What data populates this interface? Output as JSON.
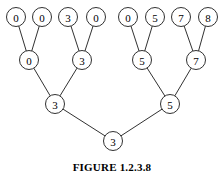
{
  "figure": {
    "caption": "FIGURE 1.2.3.8",
    "background_color": "#ffffff",
    "line_color": "#1a1a1a",
    "node_fill_color": "#ffffff",
    "text_color": "#000000"
  },
  "chart_data": {
    "type": "diagram",
    "diagram_kind": "binary-tournament-tree",
    "title": "FIGURE 1.2.3.8",
    "node_radius": 9.5,
    "levels": [
      {
        "level": 0,
        "name": "leaf-level",
        "y": 17,
        "nodes": [
          {
            "id": "L0",
            "label": "0",
            "x": 16,
            "y": 17
          },
          {
            "id": "L1",
            "label": "0",
            "x": 42,
            "y": 17
          },
          {
            "id": "L2",
            "label": "3",
            "x": 68,
            "y": 17
          },
          {
            "id": "L3",
            "label": "0",
            "x": 96,
            "y": 17
          },
          {
            "id": "L4",
            "label": "0",
            "x": 128,
            "y": 17
          },
          {
            "id": "L5",
            "label": "5",
            "x": 155,
            "y": 17
          },
          {
            "id": "L6",
            "label": "7",
            "x": 181,
            "y": 17
          },
          {
            "id": "L7",
            "label": "8",
            "x": 208,
            "y": 17
          }
        ]
      },
      {
        "level": 1,
        "name": "quarterfinal-level",
        "y": 60,
        "nodes": [
          {
            "id": "Q0",
            "label": "0",
            "x": 29,
            "y": 60
          },
          {
            "id": "Q1",
            "label": "3",
            "x": 82,
            "y": 60
          },
          {
            "id": "Q2",
            "label": "5",
            "x": 142,
            "y": 60
          },
          {
            "id": "Q3",
            "label": "7",
            "x": 196,
            "y": 60
          }
        ]
      },
      {
        "level": 2,
        "name": "semifinal-level",
        "y": 104,
        "nodes": [
          {
            "id": "S0",
            "label": "3",
            "x": 55,
            "y": 104
          },
          {
            "id": "S1",
            "label": "5",
            "x": 170,
            "y": 104
          }
        ]
      },
      {
        "level": 3,
        "name": "root-level",
        "y": 141,
        "nodes": [
          {
            "id": "R0",
            "label": "3",
            "x": 113,
            "y": 141
          }
        ]
      }
    ],
    "edges": [
      {
        "from": "Q0",
        "to": "L0"
      },
      {
        "from": "Q0",
        "to": "L1"
      },
      {
        "from": "Q1",
        "to": "L2"
      },
      {
        "from": "Q1",
        "to": "L3"
      },
      {
        "from": "Q2",
        "to": "L4"
      },
      {
        "from": "Q2",
        "to": "L5"
      },
      {
        "from": "Q3",
        "to": "L6"
      },
      {
        "from": "Q3",
        "to": "L7"
      },
      {
        "from": "S0",
        "to": "Q0"
      },
      {
        "from": "S0",
        "to": "Q1"
      },
      {
        "from": "S1",
        "to": "Q2"
      },
      {
        "from": "S1",
        "to": "Q3"
      },
      {
        "from": "R0",
        "to": "S0"
      },
      {
        "from": "R0",
        "to": "S1"
      }
    ]
  }
}
